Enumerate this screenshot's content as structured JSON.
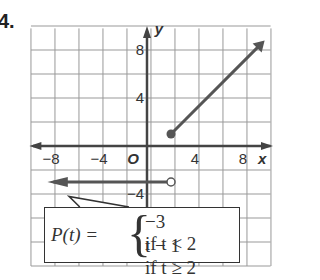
{
  "problem_number": "4.",
  "chart_data": {
    "type": "line",
    "title": "",
    "xlabel": "x",
    "ylabel": "y",
    "origin_label": "O",
    "xlim": [
      -10,
      10
    ],
    "ylim": [
      -8,
      10
    ],
    "x_ticks": [
      "-8",
      "-4",
      "4",
      "8"
    ],
    "y_ticks": [
      "8",
      "4",
      "-4"
    ],
    "grid": true,
    "grid_step": 2,
    "series": [
      {
        "name": "P(t) = -3 if t < 2",
        "points": [
          [
            2,
            -3
          ],
          [
            -8,
            -3
          ]
        ],
        "start_marker": "open",
        "end": "arrow-left"
      },
      {
        "name": "P(t) = t - 1 if t >= 2",
        "points": [
          [
            2,
            1
          ],
          [
            9.5,
            8.5
          ]
        ],
        "start_marker": "closed",
        "end": "arrow-right"
      }
    ],
    "annotation": {
      "lhs": "P(t) =",
      "cases": [
        {
          "value": "−3",
          "condition": "if t < 2"
        },
        {
          "value": "t − 1",
          "condition": "if t ≥ 2"
        }
      ]
    }
  },
  "colors": {
    "grid": "#888888",
    "axis": "#444444",
    "graph": "#555555"
  }
}
